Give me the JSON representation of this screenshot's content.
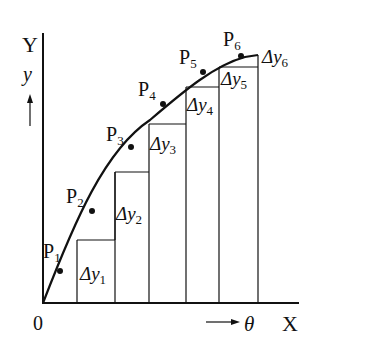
{
  "diagram": {
    "axis_labels": {
      "y_axis": "Y",
      "x_axis": "X",
      "origin": "0",
      "y_var": "y",
      "x_var": "θ"
    },
    "points": [
      {
        "name": "P",
        "sub": "1"
      },
      {
        "name": "P",
        "sub": "2"
      },
      {
        "name": "P",
        "sub": "3"
      },
      {
        "name": "P",
        "sub": "4"
      },
      {
        "name": "P",
        "sub": "5"
      },
      {
        "name": "P",
        "sub": "6"
      }
    ],
    "deltas": [
      {
        "name": "Δy",
        "sub": "1"
      },
      {
        "name": "Δy",
        "sub": "2"
      },
      {
        "name": "Δy",
        "sub": "3"
      },
      {
        "name": "Δy",
        "sub": "4"
      },
      {
        "name": "Δy",
        "sub": "5"
      },
      {
        "name": "Δy",
        "sub": "6"
      }
    ],
    "colors": {
      "line": "#111111",
      "background": "#ffffff"
    }
  }
}
